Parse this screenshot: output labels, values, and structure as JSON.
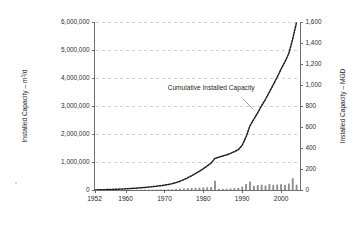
{
  "chart_data": {
    "type": "bar",
    "title": "",
    "annotations": [
      {
        "text": "Cumulative Installed Capacity",
        "x": 1982,
        "y": 3500000
      }
    ],
    "xlabel": "",
    "ylabel": "Installed Capacity – m³/d",
    "y2label": "Installed Capacity – MGD",
    "xlim": [
      1952,
      2005
    ],
    "ylim": [
      0,
      6000000
    ],
    "y2lim": [
      0,
      1600
    ],
    "grid": true,
    "legend_position": "none",
    "xticks": [
      1952,
      1960,
      1970,
      1980,
      1990,
      2000
    ],
    "xtick_labels": [
      "1952",
      "1960",
      "1970",
      "1980",
      "1990",
      "2000"
    ],
    "yticks": [
      0,
      1000000,
      2000000,
      3000000,
      4000000,
      5000000,
      6000000
    ],
    "ytick_labels": [
      "0",
      "1,000,000",
      "2,000,000",
      "3,000,000",
      "4,000,000",
      "5,000,000",
      "6,000,000"
    ],
    "y2ticks": [
      0,
      200,
      400,
      600,
      800,
      1000,
      1200,
      1400,
      1600
    ],
    "y2tick_labels": [
      "0",
      "200",
      "400",
      "600",
      "800",
      "1,000",
      "1,200",
      "1,400",
      "1,600"
    ],
    "x": [
      1952,
      1953,
      1954,
      1955,
      1956,
      1957,
      1958,
      1959,
      1960,
      1961,
      1962,
      1963,
      1964,
      1965,
      1966,
      1967,
      1968,
      1969,
      1970,
      1971,
      1972,
      1973,
      1974,
      1975,
      1976,
      1977,
      1978,
      1979,
      1980,
      1981,
      1982,
      1983,
      1984,
      1985,
      1986,
      1987,
      1988,
      1989,
      1990,
      1991,
      1992,
      1993,
      1994,
      1995,
      1996,
      1997,
      1998,
      1999,
      2000,
      2001,
      2002,
      2003,
      2004
    ],
    "series": [
      {
        "name": "Annual Installed Capacity",
        "type": "bar",
        "unit": "m3/d",
        "values": [
          3000,
          3000,
          4000,
          4000,
          5000,
          5000,
          6000,
          6000,
          7000,
          8000,
          9000,
          10000,
          11000,
          12000,
          13000,
          14000,
          16000,
          18000,
          20000,
          24000,
          30000,
          38000,
          48000,
          58000,
          66000,
          72000,
          78000,
          84000,
          90000,
          96000,
          104000,
          330000,
          44000,
          40000,
          42000,
          52000,
          62000,
          72000,
          120000,
          210000,
          300000,
          150000,
          175000,
          190000,
          160000,
          210000,
          185000,
          195000,
          205000,
          185000,
          230000,
          420000,
          190000
        ]
      },
      {
        "name": "Cumulative Installed Capacity",
        "type": "line",
        "style": "dotted",
        "unit": "m3/d",
        "values": [
          3000,
          6000,
          10000,
          14000,
          19000,
          24000,
          30000,
          36000,
          43000,
          51000,
          60000,
          70000,
          81000,
          93000,
          106000,
          120000,
          136000,
          154000,
          174000,
          198000,
          228000,
          266000,
          314000,
          372000,
          438000,
          510000,
          588000,
          672000,
          762000,
          858000,
          962000,
          1130000,
          1174000,
          1214000,
          1256000,
          1308000,
          1370000,
          1442000,
          1600000,
          1900000,
          2290000,
          2530000,
          2760000,
          3010000,
          3240000,
          3500000,
          3760000,
          4030000,
          4320000,
          4580000,
          4880000,
          5400000,
          6000000
        ]
      }
    ]
  },
  "figure": {
    "background_color": "#ffffff",
    "bar_color": "#8d8d8d",
    "curve_color": "#1c1c1c",
    "grid_color": "#b9b9c4",
    "axis_color": "#6f6f6f"
  }
}
